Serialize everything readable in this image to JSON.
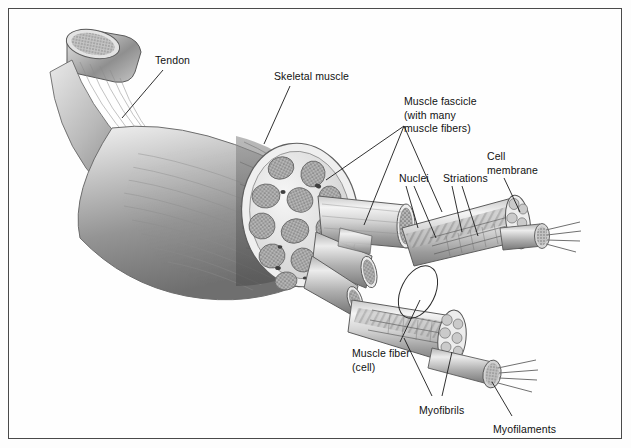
{
  "figure": {
    "style": "grayscale-medical-illustration",
    "border_color": "#4a4a4a",
    "background_color": "#fefefe",
    "text_color": "#111111"
  },
  "labels": [
    {
      "id": "tendon",
      "text": "Tendon",
      "x": 155,
      "y": 54,
      "leaders": 1
    },
    {
      "id": "skeletal",
      "text": "Skeletal muscle",
      "x": 274,
      "y": 70,
      "leaders": 1
    },
    {
      "id": "fascicle",
      "text": "Muscle fascicle\n(with many\nmuscle fibers)",
      "x": 404,
      "y": 95,
      "leaders": 2
    },
    {
      "id": "nuclei",
      "text": "Nuclei",
      "x": 399,
      "y": 172,
      "leaders": 2
    },
    {
      "id": "striations",
      "text": "Striations",
      "x": 443,
      "y": 172,
      "leaders": 2
    },
    {
      "id": "cellmembrane",
      "text": "Cell\nmembrane",
      "x": 487,
      "y": 150,
      "leaders": 1
    },
    {
      "id": "musclefiber",
      "text": "Muscle fiber\n(cell)",
      "x": 352,
      "y": 347,
      "leaders": 1
    },
    {
      "id": "myofibrils",
      "text": "Myofibrils",
      "x": 419,
      "y": 404,
      "leaders": 2
    },
    {
      "id": "myofilaments",
      "text": "Myofilaments",
      "x": 493,
      "y": 423,
      "leaders": 1
    }
  ],
  "structures": [
    {
      "id": "tendon-body",
      "name": "tendon",
      "note": "cylindrical cut cord, speckled cut face, upper-left"
    },
    {
      "id": "muscle-belly",
      "name": "skeletal-muscle",
      "note": "fibrous tapering belly, striated shading"
    },
    {
      "id": "muscle-cross-section",
      "name": "muscle-cross-section",
      "note": "oval cut face showing many stippled fascicles in pale epimysium"
    },
    {
      "id": "fascicle-bundles",
      "name": "muscle-fascicles",
      "note": "protruding cylinders with honeycomb cut ends"
    },
    {
      "id": "fiber-upper",
      "name": "muscle-fiber-upper",
      "note": "magnified striated fiber, upper right"
    },
    {
      "id": "fiber-lower",
      "name": "muscle-fiber-lower",
      "note": "magnified striated fiber, lower right"
    },
    {
      "id": "myofibril-upper",
      "name": "myofibril",
      "note": "stippled cylinder emerging from upper fiber"
    },
    {
      "id": "myofibril-lower",
      "name": "myofibril",
      "note": "stippled cylinder emerging from lower fiber"
    },
    {
      "id": "filaments-upper",
      "name": "myofilaments",
      "note": "thin strands from upper myofibril"
    },
    {
      "id": "filaments-lower",
      "name": "myofilaments",
      "note": "thin strands from lower myofibril"
    },
    {
      "id": "fiber-highlight",
      "name": "fiber-callout-ellipse",
      "note": "ellipse encircling one fiber near 418,292"
    }
  ]
}
